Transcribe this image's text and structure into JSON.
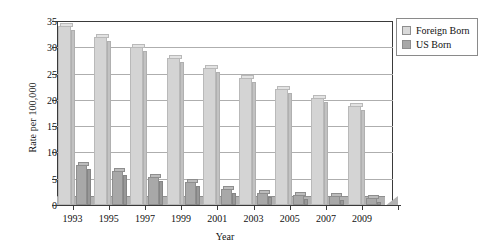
{
  "chart_data": {
    "type": "bar",
    "title": "",
    "xlabel": "Year",
    "ylabel": "Rate per 100,000",
    "categories": [
      "1993",
      "1995",
      "1997",
      "1999",
      "2001",
      "2003",
      "2005",
      "2007",
      "2009"
    ],
    "series": [
      {
        "name": "Foreign Born",
        "color": "#d4d4d4",
        "values": [
          34.0,
          32.0,
          30.0,
          28.0,
          26.1,
          24.1,
          22.0,
          20.3,
          18.9
        ]
      },
      {
        "name": "US Born",
        "color": "#a8a8a8",
        "values": [
          7.7,
          6.4,
          5.3,
          4.3,
          3.1,
          2.3,
          2.0,
          1.8,
          1.4
        ]
      }
    ],
    "ylim": [
      0,
      35
    ],
    "yticks": [
      "0",
      "5",
      "10",
      "15",
      "20",
      "25",
      "30",
      "35"
    ],
    "ytick_values": [
      0,
      5,
      10,
      15,
      20,
      25,
      30,
      35
    ],
    "grid": true,
    "legend_position": "top-right",
    "legend_entries": [
      "Foreign Born",
      "US Born"
    ]
  },
  "axes": {
    "y_title": "Rate per 100,000",
    "x_title": "Year"
  },
  "legend": {
    "items": [
      {
        "label": "Foreign Born",
        "swatch": "foreign"
      },
      {
        "label": "US Born",
        "swatch": "us"
      }
    ]
  }
}
